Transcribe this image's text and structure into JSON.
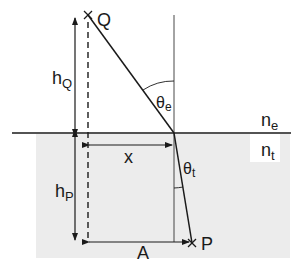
{
  "diagram": {
    "type": "refraction geometry",
    "colors": {
      "background": "#ffffff",
      "medium_t": "#ececec",
      "line": "#1a1a1a",
      "normal": "#333333"
    },
    "points": {
      "Q": {
        "label": "Q",
        "x": 88,
        "y": 15
      },
      "P": {
        "label": "P",
        "x": 192,
        "y": 243
      },
      "O": {
        "x": 174,
        "y": 133
      }
    },
    "labels": {
      "hQ_main": "h",
      "hQ_sub": "Q",
      "hP_main": "h",
      "hP_sub": "P",
      "x": "x",
      "A": "A",
      "theta_e_main": "θ",
      "theta_e_sub": "e",
      "theta_t_main": "θ",
      "theta_t_sub": "t",
      "ne_main": "n",
      "ne_sub": "e",
      "nt_main": "n",
      "nt_sub": "t",
      "Q": "Q",
      "P": "P"
    }
  }
}
